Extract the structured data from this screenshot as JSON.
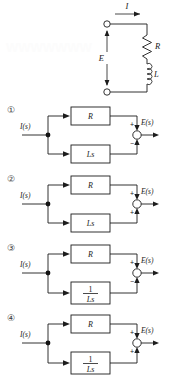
{
  "figure": {
    "watermark_text": "WWWWWWW",
    "circuit": {
      "current_label": "I",
      "voltage_label": "E",
      "resistor_label": "R",
      "inductor_label": "L"
    },
    "options": [
      {
        "number": "①",
        "input_label": "I(s)",
        "output_label": "E(s)",
        "top_block": "R",
        "bottom_block": "Ls",
        "bottom_block_is_fraction": false,
        "bottom_numerator": "",
        "bottom_denominator": "",
        "top_sign": "+",
        "bottom_sign": "−"
      },
      {
        "number": "②",
        "input_label": "I(s)",
        "output_label": "E(s)",
        "top_block": "R",
        "bottom_block": "Ls",
        "bottom_block_is_fraction": false,
        "bottom_numerator": "",
        "bottom_denominator": "",
        "top_sign": "+",
        "bottom_sign": "+"
      },
      {
        "number": "③",
        "input_label": "I(s)",
        "output_label": "E(s)",
        "top_block": "R",
        "bottom_block": "",
        "bottom_block_is_fraction": true,
        "bottom_numerator": "1",
        "bottom_denominator": "Ls",
        "top_sign": "+",
        "bottom_sign": "−"
      },
      {
        "number": "④",
        "input_label": "I(s)",
        "output_label": "E(s)",
        "top_block": "R",
        "bottom_block": "",
        "bottom_block_is_fraction": true,
        "bottom_numerator": "1",
        "bottom_denominator": "Ls",
        "top_sign": "+",
        "bottom_sign": "+"
      }
    ],
    "colors": {
      "ink": "#1c1c1c",
      "paper": "#ffffff"
    }
  }
}
